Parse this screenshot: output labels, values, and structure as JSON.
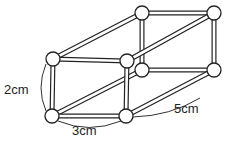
{
  "figure": {
    "labels": {
      "height": "2cm",
      "width": "3cm",
      "depth": "5cm"
    },
    "vertices": 8,
    "edges": 12
  }
}
